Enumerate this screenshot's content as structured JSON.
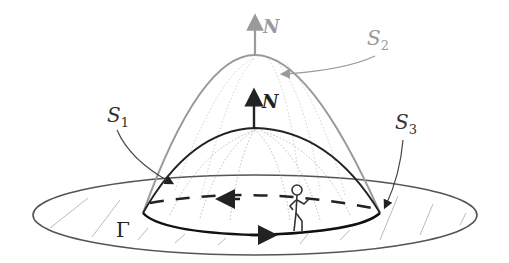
{
  "diagram": {
    "labels": {
      "normal_outer": "N",
      "normal_inner": "N",
      "surface_1": "S",
      "surface_1_sub": "1",
      "surface_2": "S",
      "surface_2_sub": "2",
      "surface_3": "S",
      "surface_3_sub": "3",
      "boundary": "Γ"
    },
    "colors": {
      "dark": "#222222",
      "gray": "#9a9a9a",
      "light": "#b5b5b5",
      "background": "#ffffff"
    },
    "elements": [
      {
        "name": "surface-S1",
        "description": "inner dome, dark outline, dotted meridians"
      },
      {
        "name": "surface-S2",
        "description": "tall outer dome, gray outline, dotted meridians"
      },
      {
        "name": "surface-S3",
        "description": "flat annular disk / ellipse with hatching"
      },
      {
        "name": "boundary-Gamma",
        "description": "oriented closed curve with arrows, solid front and dashed back"
      },
      {
        "name": "stick-figure",
        "description": "walker on boundary indicating orientation"
      }
    ]
  }
}
